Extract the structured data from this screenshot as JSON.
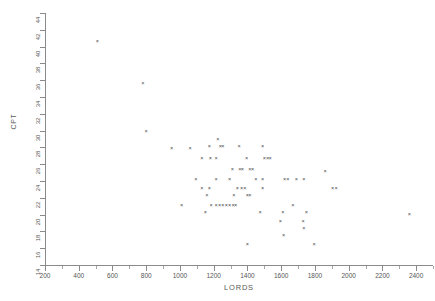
{
  "chart_data": {
    "type": "scatter",
    "title": "",
    "xlabel": "LORDS",
    "ylabel": "CPT",
    "xlim": [
      200,
      2500
    ],
    "ylim": [
      14,
      44
    ],
    "grid": false,
    "legend": null,
    "marker": "x",
    "marker_color": "#4a4a4a",
    "xticks": [
      200,
      400,
      600,
      800,
      1000,
      1200,
      1400,
      1600,
      1800,
      2000,
      2200,
      2400
    ],
    "xtick_labels": [
      "200",
      "400",
      "600",
      "800",
      "1000",
      "1200",
      "1400",
      "1600",
      "1800",
      "2000",
      "2200",
      "2400"
    ],
    "xtick_minor_step": 100,
    "yticks": [
      14,
      16,
      18,
      20,
      22,
      24,
      26,
      28,
      30,
      32,
      34,
      36,
      38,
      40,
      42,
      44
    ],
    "ytick_labels": [
      "14",
      "16",
      "18",
      "20",
      "22",
      "24",
      "26",
      "28",
      "30",
      "32",
      "34",
      "36",
      "38",
      "40",
      "42",
      "44"
    ],
    "points": [
      [
        510,
        40.6
      ],
      [
        780,
        35.6
      ],
      [
        800,
        29.9
      ],
      [
        1225,
        28.9
      ],
      [
        1175,
        28.1
      ],
      [
        1240,
        28.1
      ],
      [
        1255,
        28.1
      ],
      [
        1350,
        28.1
      ],
      [
        1490,
        28.1
      ],
      [
        950,
        27.9
      ],
      [
        1060,
        27.9
      ],
      [
        1130,
        26.7
      ],
      [
        1180,
        26.7
      ],
      [
        1215,
        26.7
      ],
      [
        1395,
        26.7
      ],
      [
        1500,
        26.7
      ],
      [
        1520,
        26.7
      ],
      [
        1535,
        26.7
      ],
      [
        1310,
        25.4
      ],
      [
        1355,
        25.4
      ],
      [
        1370,
        25.4
      ],
      [
        1415,
        25.4
      ],
      [
        1430,
        25.4
      ],
      [
        1860,
        25.1
      ],
      [
        1095,
        24.2
      ],
      [
        1215,
        24.2
      ],
      [
        1295,
        24.2
      ],
      [
        1450,
        24.2
      ],
      [
        1490,
        24.2
      ],
      [
        1620,
        24.2
      ],
      [
        1640,
        24.2
      ],
      [
        1690,
        24.2
      ],
      [
        1735,
        24.2
      ],
      [
        1130,
        23.1
      ],
      [
        1175,
        23.1
      ],
      [
        1340,
        23.1
      ],
      [
        1365,
        23.1
      ],
      [
        1385,
        23.1
      ],
      [
        1490,
        23.1
      ],
      [
        1905,
        23.1
      ],
      [
        1925,
        23.1
      ],
      [
        1160,
        22.3
      ],
      [
        1320,
        22.3
      ],
      [
        1400,
        22.3
      ],
      [
        1415,
        22.3
      ],
      [
        1010,
        21.1
      ],
      [
        1185,
        21.1
      ],
      [
        1215,
        21.1
      ],
      [
        1235,
        21.1
      ],
      [
        1255,
        21.1
      ],
      [
        1275,
        21.1
      ],
      [
        1295,
        21.1
      ],
      [
        1315,
        21.1
      ],
      [
        1330,
        21.1
      ],
      [
        1670,
        21.1
      ],
      [
        1150,
        20.2
      ],
      [
        1475,
        20.2
      ],
      [
        1610,
        20.2
      ],
      [
        1750,
        20.2
      ],
      [
        2360,
        20.0
      ],
      [
        1595,
        19.2
      ],
      [
        1730,
        19.2
      ],
      [
        1735,
        18.4
      ],
      [
        1615,
        17.5
      ],
      [
        1400,
        16.4
      ],
      [
        1795,
        16.4
      ]
    ]
  }
}
